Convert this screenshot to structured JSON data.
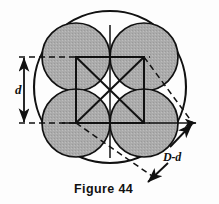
{
  "figure": {
    "caption": "Figure 44",
    "labels": {
      "inner_diameter": "d",
      "annulus_gap": "D-d"
    },
    "colors": {
      "circle_fill": "#a9a9a9",
      "stroke": "#111111",
      "background": "#fdfdfd"
    },
    "geometry": {
      "outer_circle": {
        "cx": 110,
        "cy": 87,
        "r": 76
      },
      "inner_circles": [
        {
          "cx": 76,
          "cy": 57,
          "r": 34
        },
        {
          "cx": 144,
          "cy": 57,
          "r": 34
        },
        {
          "cx": 76,
          "cy": 123,
          "r": 34
        },
        {
          "cx": 144,
          "cy": 123,
          "r": 34
        }
      ],
      "square": {
        "x": 76,
        "y": 57,
        "w": 68,
        "h": 66
      },
      "dimension_line_x": 24,
      "dashed_top_y": 57,
      "dashed_bottom_y": 123
    }
  }
}
